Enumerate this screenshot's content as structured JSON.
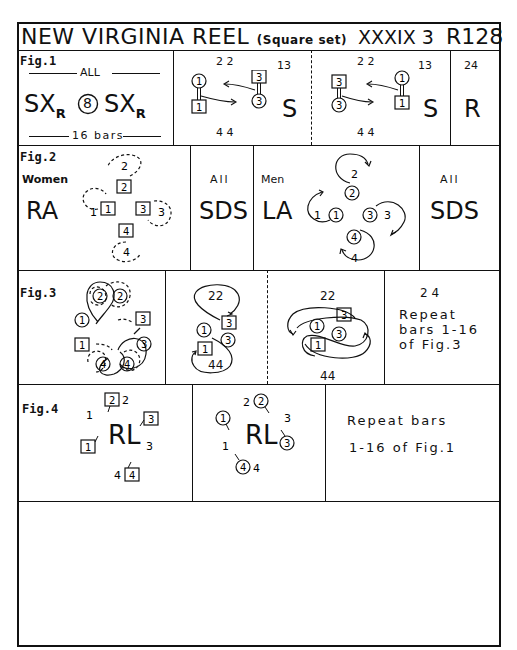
{
  "header": {
    "title": "NEW VIRGINIA REEL",
    "subtitle": "(Square set)",
    "book": "XXXIX 3",
    "code": "R128"
  },
  "fig1": {
    "label": "Fig.1",
    "all_label": "ALL",
    "formation": "SX",
    "subscript": "R",
    "bars_circle": "8",
    "bars_label": "16 bars",
    "panel_a": {
      "top_nums": "2 2",
      "bottom_nums": "4 4",
      "side_nums": "13",
      "action": "S"
    },
    "panel_b": {
      "top_nums": "2 2",
      "bottom_nums": "4 4",
      "side_nums": "13",
      "action": "S"
    },
    "panel_c": {
      "top_nums": "24",
      "action": "R"
    }
  },
  "fig2": {
    "label": "Fig.2",
    "women_label": "Women",
    "women_action": "RA",
    "all_label_1": "All",
    "sds_1": "SDS",
    "men_label": "Men",
    "men_action": "LA",
    "all_label_2": "All",
    "sds_2": "SDS"
  },
  "fig3": {
    "label": "Fig.3",
    "panel_b": {
      "top": "22",
      "bottom": "44"
    },
    "panel_c": {
      "top": "22",
      "bottom": "44"
    },
    "repeat": {
      "nums": "2 4",
      "line1": "Repeat",
      "line2": "bars 1-16",
      "line3": "of Fig.3"
    }
  },
  "fig4": {
    "label": "Fig.4",
    "action_1": "RL",
    "action_2": "RL",
    "repeat_line1": "Repeat bars",
    "repeat_line2": "1-16 of Fig.1"
  }
}
